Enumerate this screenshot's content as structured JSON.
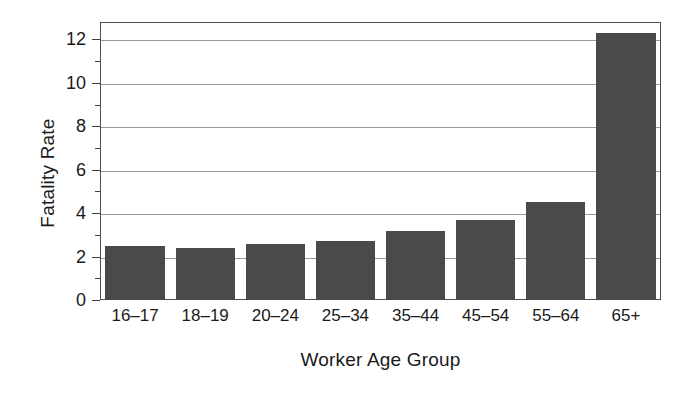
{
  "chart_data": {
    "type": "bar",
    "title": "",
    "xlabel": "Worker Age Group",
    "ylabel": "Fatality Rate",
    "categories": [
      "16–17",
      "18–19",
      "20–24",
      "25–34",
      "35–44",
      "45–54",
      "55–64",
      "65+"
    ],
    "values": [
      2.5,
      2.4,
      2.6,
      2.7,
      3.2,
      3.7,
      4.5,
      12.3
    ],
    "ylim": [
      0,
      12.8
    ],
    "yticks": [
      0,
      2,
      4,
      6,
      8,
      10,
      12
    ],
    "yticklabels": [
      "0",
      "2",
      "4",
      "6",
      "8",
      "10",
      "12"
    ],
    "yminorticks": [
      1,
      3,
      5,
      7,
      9,
      11
    ],
    "grid": "horizontal-major",
    "legend": "none",
    "bar_color": "#4a4a4a",
    "gridline_color": "#9a9a9a",
    "axis_color": "#4f4f4f",
    "background_color": "#ffffff"
  }
}
